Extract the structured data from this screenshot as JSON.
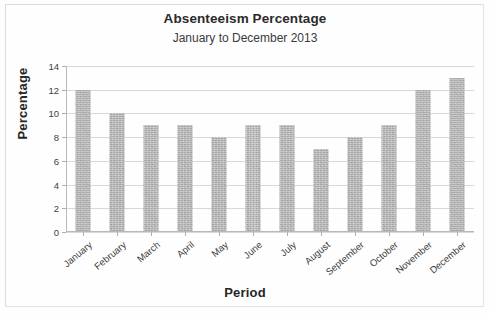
{
  "chart_data": {
    "type": "bar",
    "title": "Absenteeism Percentage",
    "subtitle": "January to December 2013",
    "xlabel": "Period",
    "ylabel": "Percentage",
    "categories": [
      "January",
      "February",
      "March",
      "April",
      "May",
      "June",
      "July",
      "August",
      "September",
      "October",
      "November",
      "December"
    ],
    "values": [
      12,
      10,
      9,
      9,
      8,
      9,
      9,
      7,
      8,
      9,
      12,
      13
    ],
    "ylim": [
      0,
      14
    ],
    "ytick_labels": [
      "0",
      "2",
      "4",
      "6",
      "8",
      "10",
      "12",
      "14"
    ],
    "ytick_values": [
      0,
      2,
      4,
      6,
      8,
      10,
      12,
      14
    ],
    "ytick_step": 2,
    "grid": true,
    "legend": false,
    "bar_color": "#ababab",
    "gridline_color": "#d8d8d8",
    "axis_color": "#b9b9b9",
    "text_color": "#2b2b2b"
  }
}
